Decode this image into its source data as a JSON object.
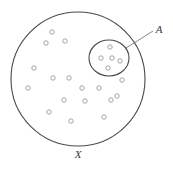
{
  "figure": {
    "type": "set-diagram",
    "background_color": "#ffffff",
    "stroke_color": "#4a4a4a",
    "point_stroke_color": "#9a9aa0",
    "label_color": "#3a3a3a",
    "canvas": {
      "width": 173,
      "height": 171
    },
    "universe": {
      "label": "X",
      "label_x": 78,
      "label_y": 158,
      "cx": 78,
      "cy": 79,
      "r": 67,
      "stroke_width": 1.1
    },
    "subset": {
      "label": "A",
      "label_x": 159,
      "label_y": 33,
      "cx": 109,
      "cy": 58,
      "rx": 20,
      "ry": 18,
      "stroke_width": 1.1
    },
    "leader_line": {
      "x1": 126,
      "y1": 48,
      "x2": 153,
      "y2": 31,
      "stroke_width": 0.8
    },
    "point_radius": 2.2,
    "points_outside_subset": [
      {
        "x": 52,
        "y": 32
      },
      {
        "x": 46,
        "y": 43
      },
      {
        "x": 65,
        "y": 41
      },
      {
        "x": 34,
        "y": 68
      },
      {
        "x": 53,
        "y": 78
      },
      {
        "x": 69,
        "y": 78
      },
      {
        "x": 28,
        "y": 88
      },
      {
        "x": 82,
        "y": 88
      },
      {
        "x": 99,
        "y": 88
      },
      {
        "x": 122,
        "y": 80
      },
      {
        "x": 64,
        "y": 100
      },
      {
        "x": 85,
        "y": 101
      },
      {
        "x": 111,
        "y": 100
      },
      {
        "x": 49,
        "y": 112
      },
      {
        "x": 71,
        "y": 121
      },
      {
        "x": 104,
        "y": 117
      },
      {
        "x": 117,
        "y": 96
      }
    ],
    "points_inside_subset": [
      {
        "x": 110,
        "y": 47
      },
      {
        "x": 101,
        "y": 58
      },
      {
        "x": 112,
        "y": 58
      },
      {
        "x": 120,
        "y": 61
      },
      {
        "x": 108,
        "y": 68
      }
    ],
    "bottom_caption": " "
  }
}
